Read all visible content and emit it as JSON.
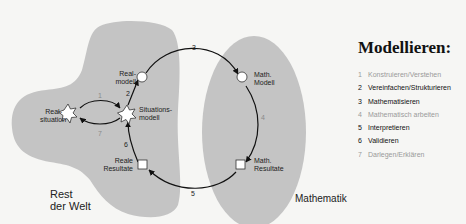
{
  "diagram": {
    "regions": {
      "rest_der_welt": "Rest\nder Welt",
      "mathematik": "Mathematik"
    },
    "nodes": {
      "realsituation": "Real-\nsituation",
      "situationsmodell": "Situations-\nmodell",
      "realmodell": "Real-\nmodell",
      "math_modell": "Math.\nModell",
      "math_resultate": "Math.\nResultate",
      "reale_resultate": "Reale\nResultate"
    },
    "edge_numbers": {
      "e1": "1",
      "e2": "2",
      "e3": "3",
      "e4": "4",
      "e5": "5",
      "e6": "6",
      "e7": "7"
    },
    "colors": {
      "region_fill": "#c4c4c4",
      "background": "#f6f6f4",
      "stroke": "#111111"
    }
  },
  "legend": {
    "title": "Modellieren:",
    "items": [
      {
        "num": "1",
        "label": "Konstruieren/Verstehen",
        "state": "faint"
      },
      {
        "num": "2",
        "label": "Vereinfachen/Strukturieren",
        "state": "active"
      },
      {
        "num": "3",
        "label": "Mathematisieren",
        "state": "active"
      },
      {
        "num": "4",
        "label": "Mathematisch arbeiten",
        "state": "faint"
      },
      {
        "num": "5",
        "label": "Interpretieren",
        "state": "active"
      },
      {
        "num": "6",
        "label": "Validieren",
        "state": "active"
      },
      {
        "num": "7",
        "label": "Darlegen/Erklären",
        "state": "faint"
      }
    ]
  }
}
